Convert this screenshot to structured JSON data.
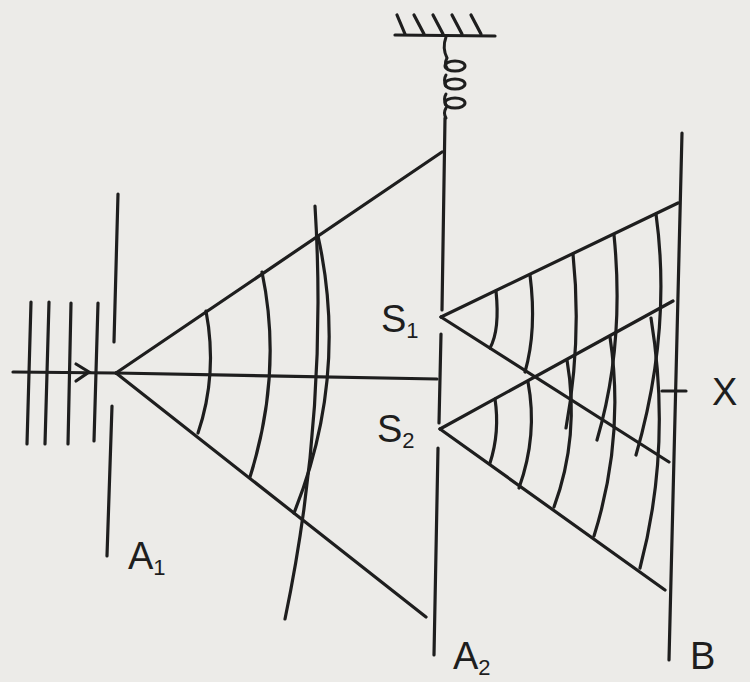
{
  "diagram": {
    "labels": {
      "a1": "A",
      "a1_sub": "1",
      "a2": "A",
      "a2_sub": "2",
      "s1": "S",
      "s1_sub": "1",
      "s2": "S",
      "s2_sub": "2",
      "b": "B",
      "x": "X"
    },
    "components": [
      "incident-plane-waves",
      "barrier-A1-single-slit",
      "spring-mounted-barrier-A2-double-slit",
      "screen-B",
      "point-X-on-screen"
    ],
    "colors": {
      "ink": "#1e1e1e",
      "paper": "#ecebe8"
    }
  }
}
